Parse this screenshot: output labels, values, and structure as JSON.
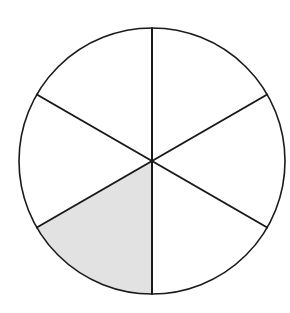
{
  "diagram": {
    "shape": "circle",
    "total_parts": 6,
    "shaded_parts": [
      3
    ],
    "shaded_fraction": "1/6",
    "sector_orientation": "vertical diameter with spokes every 60 degrees",
    "colors": {
      "outline": "#1a1a1a",
      "shaded_fill": "#e2e2e2",
      "unshaded_fill": "#ffffff",
      "background": "#ffffff"
    }
  }
}
